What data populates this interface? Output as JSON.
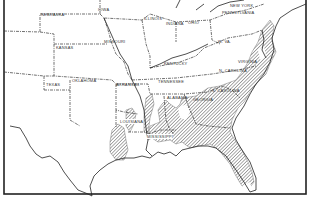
{
  "map": {
    "type": "distribution-map",
    "region": "Southeastern and Central United States",
    "legend_note": "Hatched area indicates range",
    "hatch_color": "#444444",
    "border_color": "#222222"
  },
  "labels": [
    {
      "name": "nebraska",
      "text": "NEBRASKA",
      "x": 41,
      "y": 14
    },
    {
      "name": "iowa",
      "text": "IOWA",
      "x": 98,
      "y": 9
    },
    {
      "name": "illinois",
      "text": "ILLINOIS",
      "x": 144,
      "y": 18
    },
    {
      "name": "kansas",
      "text": "KANSAS",
      "x": 56,
      "y": 47
    },
    {
      "name": "missouri",
      "text": "MISSOURI",
      "x": 104,
      "y": 41
    },
    {
      "name": "indiana",
      "text": "INDIANA",
      "x": 166,
      "y": 23
    },
    {
      "name": "ohio",
      "text": "OHIO",
      "x": 188,
      "y": 22
    },
    {
      "name": "new-york",
      "text": "NEW YORK",
      "x": 230,
      "y": 5
    },
    {
      "name": "pennsylvania",
      "text": "PENNSYLVANIA",
      "x": 222,
      "y": 12
    },
    {
      "name": "w-va",
      "text": "W. VA.",
      "x": 218,
      "y": 41
    },
    {
      "name": "kentucky",
      "text": "KENTUCKY",
      "x": 164,
      "y": 63
    },
    {
      "name": "virginia",
      "text": "VIRGINIA",
      "x": 238,
      "y": 61
    },
    {
      "name": "n-carolina",
      "text": "N. CAROLINA",
      "x": 219,
      "y": 70
    },
    {
      "name": "oklahoma",
      "text": "OKLAHOMA",
      "x": 72,
      "y": 80
    },
    {
      "name": "texas",
      "text": "TEXAS",
      "x": 46,
      "y": 84
    },
    {
      "name": "arkansas",
      "text": "ARKANSAS",
      "x": 116,
      "y": 84
    },
    {
      "name": "tennessee",
      "text": "TENNESSEE",
      "x": 158,
      "y": 81
    },
    {
      "name": "s-carolina",
      "text": "S. CAROLINA",
      "x": 212,
      "y": 90
    },
    {
      "name": "alabama",
      "text": "ALABAMA",
      "x": 167,
      "y": 97
    },
    {
      "name": "georgia",
      "text": "GEORGIA",
      "x": 193,
      "y": 99
    },
    {
      "name": "louisiana",
      "text": "LOUISIANA",
      "x": 120,
      "y": 121
    },
    {
      "name": "mississippi",
      "text": "MISSISSIPPI",
      "x": 147,
      "y": 136
    },
    {
      "name": "florida-label",
      "text": "",
      "x": 0,
      "y": 0
    }
  ]
}
